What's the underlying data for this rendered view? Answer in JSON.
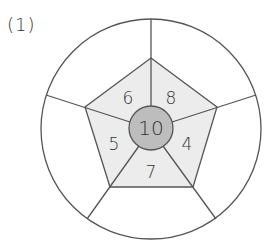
{
  "problem_label": "(1)",
  "diagram": {
    "center_value": "10",
    "inner_sections": [
      {
        "position": "top-right",
        "value": "8"
      },
      {
        "position": "right",
        "value": "4"
      },
      {
        "position": "bottom",
        "value": "7"
      },
      {
        "position": "left",
        "value": "5"
      },
      {
        "position": "top-left",
        "value": "6"
      }
    ],
    "outer_sections": [
      {
        "position": "top-right",
        "value": ""
      },
      {
        "position": "right",
        "value": ""
      },
      {
        "position": "bottom",
        "value": ""
      },
      {
        "position": "left",
        "value": ""
      },
      {
        "position": "top-left",
        "value": ""
      }
    ],
    "colors": {
      "center_fill": "#bdbdbd",
      "pentagon_fill": "#ececec",
      "stroke": "#555555"
    }
  }
}
